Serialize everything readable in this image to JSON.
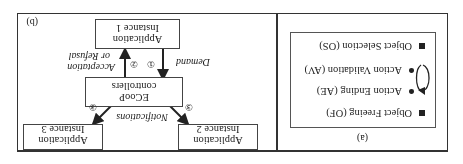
{
  "figure": {
    "orientation": "rotated 180 degrees",
    "panel_a": {
      "caption": "(a)",
      "items": [
        {
          "marker": "square",
          "label": "Object Selection (OS)"
        },
        {
          "marker": "bullet",
          "label": "Action Validation (AV)"
        },
        {
          "marker": "bullet",
          "label": "Action Ending (AE)"
        },
        {
          "marker": "square",
          "label": "Object Freeing (OF)"
        }
      ],
      "loop_icon": "cycle-arrow-icon"
    },
    "panel_b": {
      "caption": "(b)",
      "nodes": {
        "app1": {
          "line1": "Application",
          "line2": "Instance 1"
        },
        "ecoop": {
          "line1": "ECooP",
          "line2": "controllers"
        },
        "app2": {
          "line1": "Application",
          "line2": "Instance 2"
        },
        "app3": {
          "line1": "Application",
          "line2": "Instance 3"
        }
      },
      "edges": {
        "demand": {
          "num": "①",
          "label": "Demand"
        },
        "accept": {
          "num": "②",
          "label_line1": "Acceptation",
          "label_line2": "or Refusal"
        },
        "notify": {
          "num": "③",
          "label": "Notifications"
        }
      }
    }
  }
}
